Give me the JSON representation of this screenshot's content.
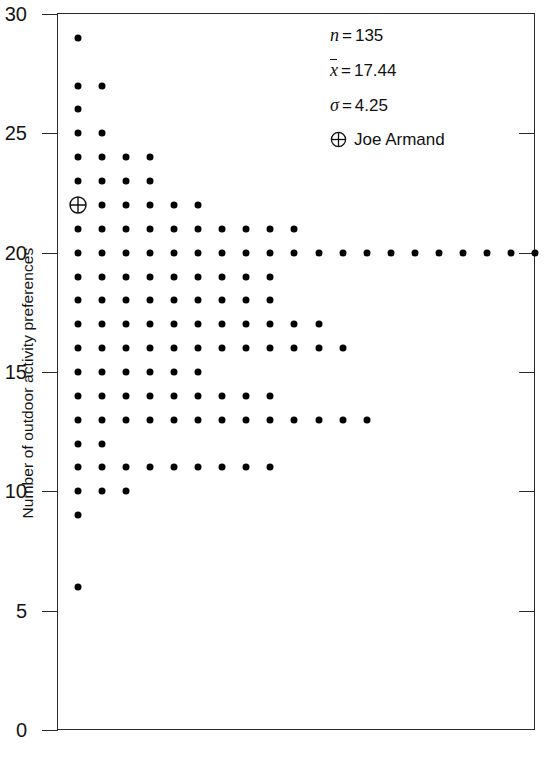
{
  "chart_data": {
    "type": "scatter",
    "plot_style": "dot-plot",
    "title": "",
    "xlabel": "",
    "ylabel": "Number of outdoor activity preferences",
    "ylim": [
      0,
      30
    ],
    "ytick_labels": [
      "0",
      "5",
      "10",
      "15",
      "20",
      "25",
      "30"
    ],
    "ytick_values": [
      0,
      5,
      10,
      15,
      20,
      25,
      30
    ],
    "grid": false,
    "legend_position": "top-right",
    "xaxis_visible_ticks": false,
    "counts_by_value": [
      {
        "value": 29,
        "count": 1
      },
      {
        "value": 27,
        "count": 2
      },
      {
        "value": 26,
        "count": 1
      },
      {
        "value": 25,
        "count": 2
      },
      {
        "value": 24,
        "count": 4
      },
      {
        "value": 23,
        "count": 4
      },
      {
        "value": 22,
        "count": 6
      },
      {
        "value": 21,
        "count": 10
      },
      {
        "value": 20,
        "count": 20
      },
      {
        "value": 19,
        "count": 9
      },
      {
        "value": 18,
        "count": 9
      },
      {
        "value": 17,
        "count": 11
      },
      {
        "value": 16,
        "count": 12
      },
      {
        "value": 15,
        "count": 6
      },
      {
        "value": 14,
        "count": 9
      },
      {
        "value": 13,
        "count": 13
      },
      {
        "value": 12,
        "count": 2
      },
      {
        "value": 11,
        "count": 9
      },
      {
        "value": 10,
        "count": 3
      },
      {
        "value": 9,
        "count": 1
      },
      {
        "value": 6,
        "count": 1
      }
    ],
    "highlighted_point": {
      "value": 22,
      "index": 1,
      "label": "Joe Armand",
      "marker": "circle-plus"
    },
    "annotations": [
      {
        "symbol": "n",
        "operator": "=",
        "value": "135"
      },
      {
        "symbol": "x̄",
        "operator": "=",
        "value": "17.44"
      },
      {
        "symbol": "σ",
        "operator": "=",
        "value": "4.25"
      }
    ]
  },
  "axis": {
    "y_title": "Number of outdoor activity preferences",
    "ticks": [
      {
        "label": "30",
        "value": 30
      },
      {
        "label": "25",
        "value": 25
      },
      {
        "label": "20",
        "value": 20
      },
      {
        "label": "15",
        "value": 15
      },
      {
        "label": "10",
        "value": 10
      },
      {
        "label": "5",
        "value": 5
      },
      {
        "label": "0",
        "value": 0
      }
    ]
  },
  "annotations": {
    "n_symbol": "n",
    "n_equals": "=",
    "n_value": "135",
    "mean_symbol": "x",
    "mean_equals": "=",
    "mean_value": "17.44",
    "sigma_symbol": "σ",
    "sigma_equals": "=",
    "sigma_value": "4.25",
    "legend_label": "Joe Armand",
    "legend_marker_name": "circle-plus-icon"
  }
}
